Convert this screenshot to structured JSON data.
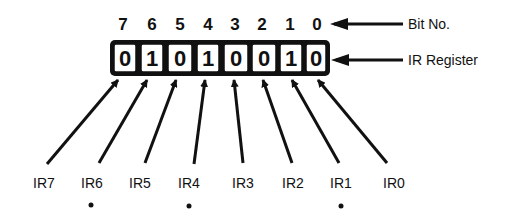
{
  "diagram": {
    "bit_numbers": [
      "7",
      "6",
      "5",
      "4",
      "3",
      "2",
      "1",
      "0"
    ],
    "register_values": [
      "0",
      "1",
      "0",
      "1",
      "0",
      "0",
      "1",
      "0"
    ],
    "annotations": {
      "bit_no": "Bit No.",
      "ir_register": "IR Register"
    },
    "inputs": [
      {
        "label": "IR7",
        "marked": false
      },
      {
        "label": "IR6",
        "marked": true
      },
      {
        "label": "IR5",
        "marked": false
      },
      {
        "label": "IR4",
        "marked": true
      },
      {
        "label": "IR3",
        "marked": false
      },
      {
        "label": "IR2",
        "marked": false
      },
      {
        "label": "IR1",
        "marked": true
      },
      {
        "label": "IR0",
        "marked": false
      }
    ],
    "marker_symbol": "•"
  }
}
